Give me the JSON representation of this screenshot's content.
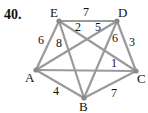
{
  "problem_number": "40.",
  "graph": {
    "nodes": [
      {
        "id": "E",
        "x": 59,
        "y": 21,
        "lx": 50,
        "ly": 17
      },
      {
        "id": "D",
        "x": 117,
        "y": 21,
        "lx": 118,
        "ly": 17
      },
      {
        "id": "A",
        "x": 36,
        "y": 70,
        "lx": 25,
        "ly": 82
      },
      {
        "id": "C",
        "x": 136,
        "y": 71,
        "lx": 137,
        "ly": 83
      },
      {
        "id": "B",
        "x": 84,
        "y": 98,
        "lx": 79,
        "ly": 111
      }
    ],
    "edges": [
      {
        "from": "E",
        "to": "D",
        "weight": "7",
        "lx": 83,
        "ly": 16
      },
      {
        "from": "E",
        "to": "A",
        "weight": "6",
        "lx": 38,
        "ly": 44
      },
      {
        "from": "E",
        "to": "B",
        "weight": "8",
        "lx": 56,
        "ly": 47
      },
      {
        "from": "E",
        "to": "C",
        "weight": "2",
        "lx": 75,
        "ly": 31
      },
      {
        "from": "D",
        "to": "A",
        "weight": "5",
        "lx": 95,
        "ly": 31
      },
      {
        "from": "D",
        "to": "B",
        "weight": "6",
        "lx": 112,
        "ly": 42
      },
      {
        "from": "D",
        "to": "C",
        "weight": "3",
        "lx": 129,
        "ly": 46
      },
      {
        "from": "A",
        "to": "C",
        "weight": "1",
        "lx": 111,
        "ly": 67
      },
      {
        "from": "A",
        "to": "B",
        "weight": "4",
        "lx": 53,
        "ly": 95
      },
      {
        "from": "B",
        "to": "C",
        "weight": "7",
        "lx": 111,
        "ly": 97
      }
    ]
  }
}
